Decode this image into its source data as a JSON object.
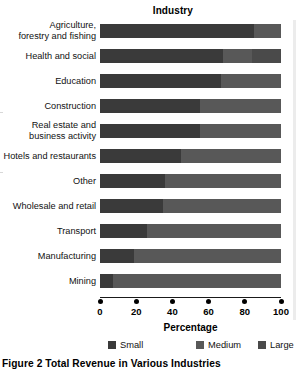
{
  "caption": "Figure 2  Total Revenue in Various Industries",
  "axes": {
    "y_title": "Industry",
    "x_title": "Percentage"
  },
  "legend": {
    "items": [
      {
        "label": "Small",
        "color": "#3a3a3a"
      },
      {
        "label": "Medium",
        "color": "#585858"
      },
      {
        "label": "Large",
        "color": "#4a4a4a"
      }
    ]
  },
  "chart_data": {
    "type": "bar",
    "title": "Figure 2  Total Revenue in Various Industries",
    "subtitle": "",
    "orientation": "horizontal",
    "stacked": true,
    "stack_total": 100,
    "xlabel": "Percentage",
    "ylabel": "Industry",
    "xlim": [
      0,
      100
    ],
    "xticks": [
      0,
      20,
      40,
      60,
      80,
      100
    ],
    "xtick_labels": [
      "0",
      "20",
      "40",
      "60",
      "80",
      "100"
    ],
    "grid": false,
    "legend_position": "bottom",
    "categories": [
      "Agriculture, forestry and fishing",
      "Health and social",
      "Education",
      "Construction",
      "Real estate and business activity",
      "Hotels and restaurants",
      "Other",
      "Wholesale and retail",
      "Transport",
      "Manufacturing",
      "Mining"
    ],
    "category_lines": [
      [
        "Agriculture,",
        "forestry and fishing"
      ],
      [
        "Health and social"
      ],
      [
        "Education"
      ],
      [
        "Construction"
      ],
      [
        "Real estate and",
        "business activity"
      ],
      [
        "Hotels and restaurants"
      ],
      [
        "Other"
      ],
      [
        "Wholesale and retail"
      ],
      [
        "Transport"
      ],
      [
        "Manufacturing"
      ],
      [
        "Mining"
      ]
    ],
    "series": [
      {
        "name": "Small",
        "color": "#3a3a3a",
        "values": [
          85,
          68,
          67,
          55,
          55,
          45,
          36,
          35,
          26,
          19,
          7
        ]
      },
      {
        "name": "Medium",
        "color": "#585858",
        "values": [
          15,
          16,
          33,
          45,
          45,
          55,
          64,
          65,
          74,
          81,
          93
        ]
      },
      {
        "name": "Large",
        "color": "#4a4a4a",
        "values": [
          0,
          16,
          0,
          0,
          0,
          0,
          0,
          0,
          0,
          0,
          0
        ]
      }
    ]
  }
}
